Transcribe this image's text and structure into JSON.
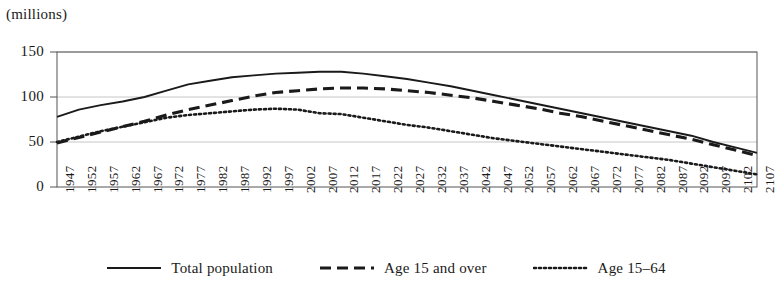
{
  "figure": {
    "unit_label": "(millions)",
    "name": "population-projection-chart"
  },
  "legend": {
    "position": "bottom-center",
    "items": [
      {
        "label": "Total population",
        "style": "solid",
        "key": "total_population"
      },
      {
        "label": "Age 15 and over",
        "style": "dashed",
        "key": "age_15_and_over"
      },
      {
        "label": "Age 15–64",
        "style": "dotted",
        "key": "age_15_64"
      }
    ]
  },
  "chart_data": {
    "type": "line",
    "title": "",
    "xlabel": "",
    "ylabel": "(millions)",
    "ylim": [
      0,
      150
    ],
    "yticks": [
      0,
      50,
      100,
      150
    ],
    "ytick_labels": [
      "0",
      "50",
      "100",
      "150"
    ],
    "grid": true,
    "grid_axis": "y",
    "categories": [
      "1947",
      "1952",
      "1957",
      "1962",
      "1967",
      "1972",
      "1977",
      "1982",
      "1987",
      "1992",
      "1997",
      "2002",
      "2007",
      "2012",
      "2017",
      "2022",
      "2027",
      "2032",
      "2037",
      "2042",
      "2047",
      "2052",
      "2057",
      "2062",
      "2067",
      "2072",
      "2077",
      "2082",
      "2087",
      "2092",
      "2097",
      "2102",
      "2107"
    ],
    "series": [
      {
        "name": "Total population",
        "style": "solid",
        "values": [
          78,
          86,
          91,
          95,
          100,
          107,
          114,
          118,
          122,
          124,
          126,
          127,
          128,
          128,
          126,
          123,
          120,
          116,
          112,
          107,
          102,
          97,
          92,
          87,
          82,
          77,
          72,
          67,
          62,
          57,
          50,
          44,
          38
        ]
      },
      {
        "name": "Age 15 and over",
        "style": "dashed",
        "values": [
          49,
          55,
          61,
          67,
          73,
          80,
          86,
          91,
          96,
          101,
          105,
          107,
          109,
          110,
          110,
          109,
          107,
          105,
          102,
          99,
          95,
          91,
          87,
          82,
          78,
          73,
          68,
          63,
          58,
          53,
          47,
          41,
          35
        ]
      },
      {
        "name": "Age 15–64",
        "style": "dotted",
        "values": [
          50,
          56,
          62,
          67,
          72,
          77,
          80,
          82,
          84,
          86,
          87,
          86,
          82,
          81,
          77,
          73,
          69,
          66,
          62,
          58,
          54,
          51,
          48,
          45,
          42,
          39,
          36,
          33,
          30,
          26,
          22,
          18,
          14
        ]
      }
    ]
  }
}
